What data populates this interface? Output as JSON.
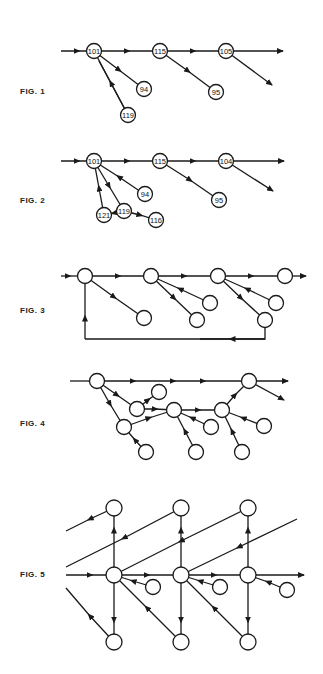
{
  "figures": [
    {
      "label": "FIG. 1",
      "node_labels": [
        "101",
        "115",
        "105",
        "94",
        "95",
        "119"
      ]
    },
    {
      "label": "FIG. 2",
      "node_labels": [
        "101",
        "115",
        "104",
        "94",
        "95",
        "121",
        "119",
        "116"
      ]
    },
    {
      "label": "FIG. 3",
      "node_labels": []
    },
    {
      "label": "FIG. 4",
      "node_labels": []
    },
    {
      "label": "FIG. 5",
      "node_labels": []
    }
  ],
  "colors": {
    "ink": "#1a1a1a",
    "background": "#ffffff"
  }
}
